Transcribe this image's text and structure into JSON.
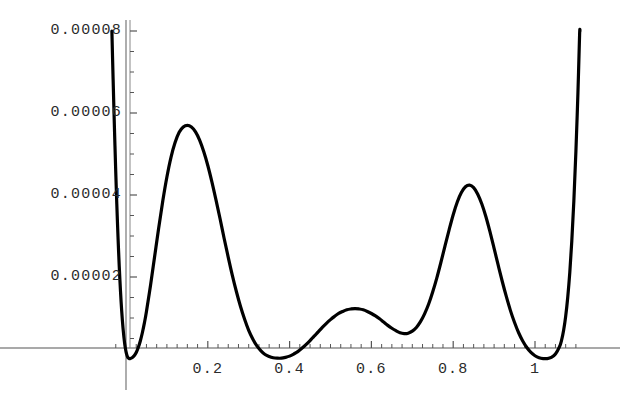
{
  "chart_data": {
    "type": "line",
    "title": "",
    "xlabel": "",
    "ylabel": "",
    "xlim": [
      -0.035,
      1.135
    ],
    "ylim": [
      0,
      8e-05
    ],
    "grid": false,
    "legend": null,
    "axis_origin": {
      "x": 0.0,
      "y": 0.0
    },
    "x_ticks_major": [
      0.2,
      0.4,
      0.6,
      0.8,
      1
    ],
    "x_tick_labels": [
      "0.2",
      "0.4",
      "0.6",
      "0.8",
      "1"
    ],
    "x_ticks_minor": [
      -0.025,
      0.025,
      0.05,
      0.075,
      0.1,
      0.125,
      0.15,
      0.175,
      0.225,
      0.25,
      0.275,
      0.3,
      0.325,
      0.35,
      0.375,
      0.425,
      0.45,
      0.475,
      0.5,
      0.525,
      0.55,
      0.575,
      0.625,
      0.65,
      0.675,
      0.7,
      0.725,
      0.75,
      0.775,
      0.825,
      0.85,
      0.875,
      0.9,
      0.925,
      0.95,
      0.975,
      1.025,
      1.05,
      1.075,
      1.1
    ],
    "y_ticks_major": [
      2e-05,
      4e-05,
      6e-05,
      8e-05
    ],
    "y_tick_labels": [
      "0.00002",
      "0.00004",
      "0.00006",
      "0.00008"
    ],
    "y_ticks_minor": [
      5e-06,
      1e-05,
      1.5e-05,
      2.5e-05,
      3e-05,
      3.5e-05,
      4.5e-05,
      5e-05,
      5.5e-05,
      6.5e-05,
      7e-05,
      7.5e-05
    ],
    "series": [
      {
        "name": "curve",
        "color": "#000000",
        "width": 3.2,
        "points": [
          [
            -0.0345,
            8e-05
          ],
          [
            -0.033,
            7.4e-05
          ],
          [
            -0.0315,
            6.82e-05
          ],
          [
            -0.03,
            6.26e-05
          ],
          [
            -0.0285,
            5.72e-05
          ],
          [
            -0.027,
            5.2e-05
          ],
          [
            -0.0255,
            4.7e-05
          ],
          [
            -0.024,
            4.23e-05
          ],
          [
            -0.0225,
            3.78e-05
          ],
          [
            -0.021,
            3.36e-05
          ],
          [
            -0.0195,
            2.97e-05
          ],
          [
            -0.018,
            2.6e-05
          ],
          [
            -0.0165,
            2.26e-05
          ],
          [
            -0.015,
            1.95e-05
          ],
          [
            -0.0135,
            1.66e-05
          ],
          [
            -0.012,
            1.4e-05
          ],
          [
            -0.0105,
            1.17e-05
          ],
          [
            -0.009,
            9.6e-06
          ],
          [
            -0.0075,
            7.8e-06
          ],
          [
            -0.006,
            6.2e-06
          ],
          [
            -0.0045,
            4.8e-06
          ],
          [
            -0.003,
            3.6e-06
          ],
          [
            -0.0015,
            2.6e-06
          ],
          [
            0.0,
            1.8e-06
          ],
          [
            0.002,
            1e-06
          ],
          [
            0.004,
            5e-07
          ],
          [
            0.006,
            2e-07
          ],
          [
            0.008,
            1e-07
          ],
          [
            0.01,
            1e-07
          ],
          [
            0.013,
            2e-07
          ],
          [
            0.016,
            4e-07
          ],
          [
            0.02,
            8e-07
          ],
          [
            0.025,
            1.6e-06
          ],
          [
            0.03,
            2.8e-06
          ],
          [
            0.035,
            4.4e-06
          ],
          [
            0.04,
            6.4e-06
          ],
          [
            0.045,
            8.8e-06
          ],
          [
            0.05,
            1.16e-05
          ],
          [
            0.06,
            1.8e-05
          ],
          [
            0.07,
            2.5e-05
          ],
          [
            0.08,
            3.2e-05
          ],
          [
            0.09,
            3.86e-05
          ],
          [
            0.1,
            4.44e-05
          ],
          [
            0.11,
            4.92e-05
          ],
          [
            0.12,
            5.28e-05
          ],
          [
            0.13,
            5.53e-05
          ],
          [
            0.14,
            5.66e-05
          ],
          [
            0.15,
            5.7e-05
          ],
          [
            0.16,
            5.66e-05
          ],
          [
            0.17,
            5.54e-05
          ],
          [
            0.18,
            5.34e-05
          ],
          [
            0.19,
            5.06e-05
          ],
          [
            0.2,
            4.72e-05
          ],
          [
            0.21,
            4.32e-05
          ],
          [
            0.22,
            3.88e-05
          ],
          [
            0.23,
            3.42e-05
          ],
          [
            0.24,
            2.94e-05
          ],
          [
            0.25,
            2.48e-05
          ],
          [
            0.26,
            2.04e-05
          ],
          [
            0.27,
            1.64e-05
          ],
          [
            0.28,
            1.28e-05
          ],
          [
            0.29,
            9.7e-06
          ],
          [
            0.3,
            7e-06
          ],
          [
            0.31,
            4.9e-06
          ],
          [
            0.32,
            3.2e-06
          ],
          [
            0.33,
            2e-06
          ],
          [
            0.34,
            1.1e-06
          ],
          [
            0.35,
            6e-07
          ],
          [
            0.36,
            3e-07
          ],
          [
            0.37,
            2e-07
          ],
          [
            0.38,
            2e-07
          ],
          [
            0.39,
            4e-07
          ],
          [
            0.4,
            7e-07
          ],
          [
            0.41,
            1.2e-06
          ],
          [
            0.42,
            1.8e-06
          ],
          [
            0.43,
            2.6e-06
          ],
          [
            0.44,
            3.5e-06
          ],
          [
            0.45,
            4.5e-06
          ],
          [
            0.46,
            5.6e-06
          ],
          [
            0.47,
            6.6e-06
          ],
          [
            0.48,
            7.7e-06
          ],
          [
            0.49,
            8.7e-06
          ],
          [
            0.5,
            9.6e-06
          ],
          [
            0.51,
            1.04e-05
          ],
          [
            0.52,
            1.11e-05
          ],
          [
            0.53,
            1.16e-05
          ],
          [
            0.54,
            1.2e-05
          ],
          [
            0.55,
            1.22e-05
          ],
          [
            0.56,
            1.23e-05
          ],
          [
            0.57,
            1.22e-05
          ],
          [
            0.58,
            1.2e-05
          ],
          [
            0.59,
            1.16e-05
          ],
          [
            0.6,
            1.11e-05
          ],
          [
            0.61,
            1.05e-05
          ],
          [
            0.62,
            9.8e-06
          ],
          [
            0.63,
            9e-06
          ],
          [
            0.64,
            8.2e-06
          ],
          [
            0.65,
            7.5e-06
          ],
          [
            0.66,
            6.9e-06
          ],
          [
            0.67,
            6.4e-06
          ],
          [
            0.68,
            6.2e-06
          ],
          [
            0.69,
            6.3e-06
          ],
          [
            0.7,
            6.8e-06
          ],
          [
            0.71,
            7.7e-06
          ],
          [
            0.72,
            9.1e-06
          ],
          [
            0.73,
            1.1e-05
          ],
          [
            0.74,
            1.34e-05
          ],
          [
            0.75,
            1.64e-05
          ],
          [
            0.76,
            1.98e-05
          ],
          [
            0.77,
            2.36e-05
          ],
          [
            0.78,
            2.76e-05
          ],
          [
            0.79,
            3.15e-05
          ],
          [
            0.8,
            3.52e-05
          ],
          [
            0.81,
            3.83e-05
          ],
          [
            0.82,
            4.06e-05
          ],
          [
            0.83,
            4.2e-05
          ],
          [
            0.84,
            4.24e-05
          ],
          [
            0.85,
            4.18e-05
          ],
          [
            0.86,
            4.02e-05
          ],
          [
            0.87,
            3.78e-05
          ],
          [
            0.88,
            3.47e-05
          ],
          [
            0.89,
            3.1e-05
          ],
          [
            0.9,
            2.7e-05
          ],
          [
            0.91,
            2.29e-05
          ],
          [
            0.92,
            1.89e-05
          ],
          [
            0.93,
            1.52e-05
          ],
          [
            0.94,
            1.18e-05
          ],
          [
            0.95,
            8.9e-06
          ],
          [
            0.96,
            6.4e-06
          ],
          [
            0.97,
            4.4e-06
          ],
          [
            0.98,
            2.8e-06
          ],
          [
            0.99,
            1.6e-06
          ],
          [
            1.0,
            8e-07
          ],
          [
            1.01,
            3e-07
          ],
          [
            1.02,
            1e-07
          ],
          [
            1.03,
            1e-07
          ],
          [
            1.04,
            4e-07
          ],
          [
            1.05,
            1.2e-06
          ],
          [
            1.06,
            3e-06
          ],
          [
            1.065,
            4.6e-06
          ],
          [
            1.07,
            7e-06
          ],
          [
            1.075,
            1.04e-05
          ],
          [
            1.08,
            1.5e-05
          ],
          [
            1.085,
            2.1e-05
          ],
          [
            1.09,
            2.88e-05
          ],
          [
            1.095,
            3.86e-05
          ],
          [
            1.1,
            5.06e-05
          ],
          [
            1.105,
            6.5e-05
          ],
          [
            1.109,
            7.9e-05
          ],
          [
            1.11,
            8e-05
          ]
        ]
      }
    ],
    "annotations": [
      {
        "label": "left-peak",
        "x": 0.15,
        "y": 5.7e-05
      },
      {
        "label": "right-peak",
        "x": 0.84,
        "y": 4.24e-05
      }
    ]
  },
  "axis_style": {
    "axis_color": "#555555",
    "curve_color": "#000000",
    "tick_color": "#555555",
    "background": "#ffffff"
  }
}
